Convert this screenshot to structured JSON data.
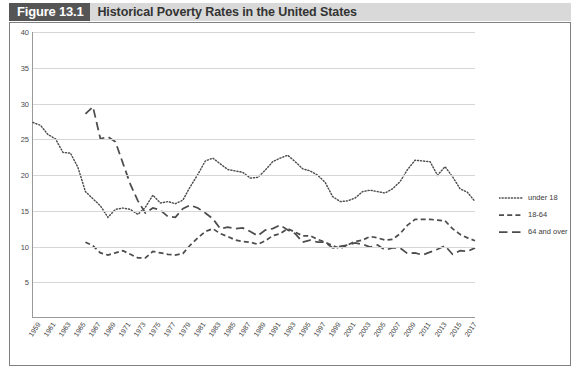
{
  "figure": {
    "number_label": "Figure 13.1",
    "title": "Historical Poverty Rates in the United States"
  },
  "legend": {
    "position": "right",
    "items": [
      {
        "label": "under 18",
        "style": "dotted",
        "color": "#4d4d4d",
        "icon": "dotted-line-icon"
      },
      {
        "label": "18-64",
        "style": "dashed",
        "color": "#4d4d4d",
        "icon": "dashed-line-icon"
      },
      {
        "label": "64 and over",
        "style": "long-dashed",
        "color": "#4d4d4d",
        "icon": "long-dashed-line-icon"
      }
    ]
  },
  "axes": {
    "y_ticks": [
      "40",
      "35",
      "30",
      "25",
      "20",
      "15",
      "10",
      "5"
    ],
    "x_ticks": [
      "1959",
      "1961",
      "1963",
      "1965",
      "1967",
      "1969",
      "1971",
      "1973",
      "1975",
      "1977",
      "1979",
      "1981",
      "1983",
      "1985",
      "1987",
      "1989",
      "1991",
      "1993",
      "1995",
      "1997",
      "1999",
      "2001",
      "2003",
      "2005",
      "2007",
      "2009",
      "2011",
      "2013",
      "2015",
      "2017"
    ]
  },
  "chart_data": {
    "type": "line",
    "title": "Historical Poverty Rates in the United States",
    "xlabel": "",
    "ylabel": "",
    "ylim": [
      0,
      40
    ],
    "xlim": [
      1959,
      2018
    ],
    "grid": true,
    "legend_position": "right",
    "x": [
      1959,
      1960,
      1961,
      1962,
      1963,
      1964,
      1965,
      1966,
      1967,
      1968,
      1969,
      1970,
      1971,
      1972,
      1973,
      1974,
      1975,
      1976,
      1977,
      1978,
      1979,
      1980,
      1981,
      1982,
      1983,
      1984,
      1985,
      1986,
      1987,
      1988,
      1989,
      1990,
      1991,
      1992,
      1993,
      1994,
      1995,
      1996,
      1997,
      1998,
      1999,
      2000,
      2001,
      2002,
      2003,
      2004,
      2005,
      2006,
      2007,
      2008,
      2009,
      2010,
      2011,
      2012,
      2013,
      2014,
      2015,
      2016,
      2017,
      2018
    ],
    "series": [
      {
        "name": "under 18",
        "style": "dotted",
        "color": "#4d4d4d",
        "values": [
          27.3,
          26.9,
          25.6,
          25.0,
          23.1,
          23.0,
          21.0,
          17.6,
          16.6,
          15.6,
          14.0,
          15.1,
          15.3,
          15.1,
          14.4,
          15.4,
          17.1,
          16.0,
          16.2,
          15.9,
          16.4,
          18.3,
          20.0,
          21.9,
          22.3,
          21.5,
          20.7,
          20.5,
          20.3,
          19.5,
          19.6,
          20.6,
          21.8,
          22.3,
          22.7,
          21.8,
          20.8,
          20.5,
          19.9,
          18.9,
          16.9,
          16.2,
          16.3,
          16.7,
          17.6,
          17.8,
          17.6,
          17.4,
          18.0,
          19.0,
          20.7,
          22.0,
          21.9,
          21.8,
          19.9,
          21.1,
          19.7,
          18.0,
          17.5,
          16.2
        ]
      },
      {
        "name": "18-64",
        "style": "dashed",
        "color": "#4d4d4d",
        "values": [
          null,
          null,
          null,
          null,
          null,
          null,
          null,
          10.5,
          10.0,
          9.0,
          8.7,
          9.0,
          9.3,
          8.8,
          8.3,
          8.3,
          9.2,
          9.0,
          8.8,
          8.7,
          8.9,
          10.1,
          11.1,
          12.0,
          12.4,
          11.7,
          11.3,
          10.8,
          10.6,
          10.5,
          10.2,
          10.7,
          11.4,
          11.7,
          12.4,
          11.9,
          11.4,
          11.4,
          10.9,
          10.5,
          10.0,
          9.6,
          10.1,
          10.6,
          10.8,
          11.3,
          11.1,
          10.8,
          10.9,
          11.7,
          12.9,
          13.7,
          13.7,
          13.7,
          13.6,
          13.5,
          12.4,
          11.6,
          11.1,
          10.7
        ]
      },
      {
        "name": "64 and over",
        "style": "long-dashed",
        "color": "#4d4d4d",
        "values": [
          null,
          null,
          null,
          null,
          null,
          null,
          null,
          28.5,
          29.5,
          25.0,
          25.3,
          24.6,
          21.6,
          18.6,
          16.3,
          14.6,
          15.3,
          15.0,
          14.1,
          14.0,
          15.2,
          15.7,
          15.3,
          14.6,
          13.8,
          12.4,
          12.6,
          12.4,
          12.5,
          12.0,
          11.4,
          12.2,
          12.4,
          12.9,
          12.2,
          11.7,
          10.5,
          10.8,
          10.5,
          10.5,
          9.7,
          9.9,
          10.1,
          10.4,
          10.2,
          9.8,
          10.1,
          9.4,
          9.7,
          9.7,
          8.9,
          9.0,
          8.7,
          9.1,
          9.5,
          10.0,
          8.8,
          9.3,
          9.2,
          9.7
        ]
      }
    ]
  }
}
